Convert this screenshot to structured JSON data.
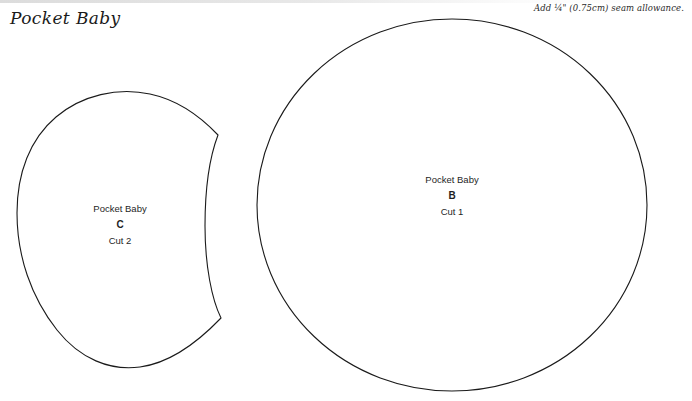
{
  "document": {
    "title": "Pocket Baby",
    "seam_allowance_note": "Add ¼\" (0.75cm) seam allowance."
  },
  "pieces": [
    {
      "name": "Pocket Baby",
      "letter": "C",
      "cut": "Cut 2",
      "shape": "crescent",
      "stroke_color": "#1a1a1a"
    },
    {
      "name": "Pocket Baby",
      "letter": "B",
      "cut": "Cut 1",
      "shape": "circle",
      "stroke_color": "#1a1a1a"
    }
  ],
  "colors": {
    "background": "#ffffff",
    "outline": "#1a1a1a",
    "text": "#1f1f1f",
    "top_band": "#dcdcdc"
  }
}
